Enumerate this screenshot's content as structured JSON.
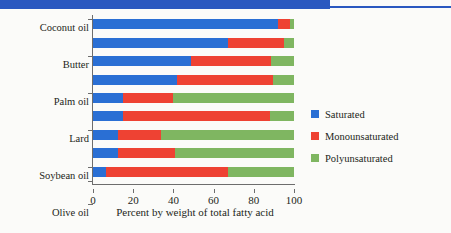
{
  "header": {
    "band_color": "#2a58c0"
  },
  "legend": {
    "position": "right",
    "items": [
      {
        "label": "Saturated",
        "color": "#2a6fd4",
        "swatch_name": "legend-swatch-saturated"
      },
      {
        "label": "Monounsaturated",
        "color": "#ee4233",
        "swatch_name": "legend-swatch-monounsaturated"
      },
      {
        "label": "Polyunsaturated",
        "color": "#7fb661",
        "swatch_name": "legend-swatch-polyunsaturated"
      }
    ]
  },
  "axis": {
    "x_title": "Percent by weight of total fatty acid",
    "x_ticks": [
      "0",
      "20",
      "40",
      "60",
      "80",
      "100"
    ]
  },
  "chart_data": {
    "type": "bar",
    "orientation": "horizontal",
    "stacked": true,
    "title": "",
    "subtitle": "",
    "xlabel": "Percent by weight of total fatty acid",
    "ylabel": "",
    "xlim": [
      0,
      100
    ],
    "xticks": [
      0,
      20,
      40,
      60,
      80,
      100
    ],
    "grid": false,
    "legend_position": "right",
    "categories": [
      "Coconut oil",
      "Butter",
      "Palm oil",
      "Lard",
      "Soybean oil",
      "Olive oil",
      "Sunflower oil",
      "Corn oil",
      "Canola oil"
    ],
    "series": [
      {
        "name": "Saturated",
        "color": "#2a6fd4",
        "values": [
          92,
          67,
          49,
          42,
          15,
          15,
          12.5,
          12.5,
          6.5
        ]
      },
      {
        "name": "Monounsaturated",
        "color": "#ee4233",
        "values": [
          6,
          28,
          39.5,
          47.5,
          25,
          73,
          21.5,
          28.5,
          60.5
        ]
      },
      {
        "name": "Polyunsaturated",
        "color": "#7fb661",
        "values": [
          2,
          5,
          11.5,
          10.5,
          60,
          12,
          66,
          59,
          33
        ]
      }
    ]
  }
}
